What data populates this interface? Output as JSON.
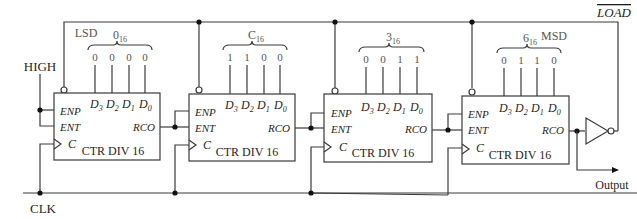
{
  "labels": {
    "high": "HIGH",
    "clk": "CLK",
    "load": "LOAD",
    "output": "Output",
    "lsd": "LSD",
    "msd": "MSD"
  },
  "counters": [
    {
      "name": "CTR DIV 16",
      "hex_digit": "0",
      "hex_sub": "16",
      "data_inputs": [
        "0",
        "0",
        "0",
        "0"
      ],
      "pins": {
        "enp": "ENP",
        "ent": "ENT",
        "clk": "C",
        "rco": "RCO",
        "d3": "D",
        "d2": "D",
        "d1": "D",
        "d0": "D",
        "s3": "3",
        "s2": "2",
        "s1": "1",
        "s0": "0"
      }
    },
    {
      "name": "CTR DIV 16",
      "hex_digit": "C",
      "hex_sub": "16",
      "data_inputs": [
        "1",
        "1",
        "0",
        "0"
      ],
      "pins": {
        "enp": "ENP",
        "ent": "ENT",
        "clk": "C",
        "rco": "RCO",
        "d3": "D",
        "d2": "D",
        "d1": "D",
        "d0": "D",
        "s3": "3",
        "s2": "2",
        "s1": "1",
        "s0": "0"
      }
    },
    {
      "name": "CTR DIV 16",
      "hex_digit": "3",
      "hex_sub": "16",
      "data_inputs": [
        "0",
        "0",
        "1",
        "1"
      ],
      "pins": {
        "enp": "ENP",
        "ent": "ENT",
        "clk": "C",
        "rco": "RCO",
        "d3": "D",
        "d2": "D",
        "d1": "D",
        "d0": "D",
        "s3": "3",
        "s2": "2",
        "s1": "1",
        "s0": "0"
      }
    },
    {
      "name": "CTR DIV 16",
      "hex_digit": "6",
      "hex_sub": "16",
      "data_inputs": [
        "0",
        "1",
        "1",
        "0"
      ],
      "pins": {
        "enp": "ENP",
        "ent": "ENT",
        "clk": "C",
        "rco": "RCO",
        "d3": "D",
        "d2": "D",
        "d1": "D",
        "d0": "D",
        "s3": "3",
        "s2": "2",
        "s1": "1",
        "s0": "0"
      }
    }
  ],
  "colors": {
    "line": "#3a3a3a",
    "text": "#1f1f1f",
    "label_gray": "#555555"
  }
}
